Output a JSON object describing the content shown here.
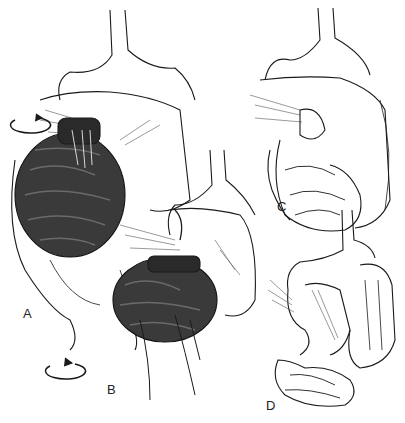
{
  "figure": {
    "panels": [
      {
        "label": "A",
        "content": "Hand holding twisted dark small bowel with counterclockwise rotation arrows"
      },
      {
        "label": "B",
        "content": "Fingers detorsing twisted bowel loop beneath stomach and colon"
      },
      {
        "label": "C",
        "content": "Bowel after detorsion, small intestine below colon"
      },
      {
        "label": "D",
        "content": "Final position with small bowel on right and colon on left after Ladd procedure"
      }
    ]
  },
  "colors": {
    "ink": "#1a1a1a",
    "bowel_dark": "#3a3a3a",
    "background": "#ffffff"
  }
}
